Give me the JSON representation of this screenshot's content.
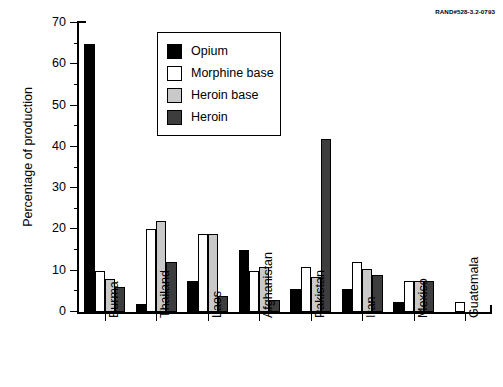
{
  "source_credit": "RAND#528-3.2-0793",
  "chart_data": {
    "type": "bar",
    "title": "",
    "subtitle": "",
    "xlabel": "",
    "ylabel": "Percentage of production",
    "ylim": [
      0,
      70
    ],
    "ytick_values": [
      0,
      10,
      20,
      30,
      40,
      50,
      60,
      70
    ],
    "ytick_labels": [
      "0",
      "10",
      "20",
      "30",
      "40",
      "50",
      "60",
      "70"
    ],
    "grid": false,
    "legend_position": "upper-center-inside",
    "categories": [
      "Burma",
      "Thailand",
      "Laos",
      "Afghanistan",
      "Pakistan",
      "Iran",
      "Mexico",
      "Guatemala"
    ],
    "series": [
      {
        "name": "Opium",
        "color": "#000000",
        "values": [
          65,
          2,
          7.5,
          15,
          5.5,
          5.5,
          2.5,
          0
        ]
      },
      {
        "name": "Morphine base",
        "color": "#ffffff",
        "values": [
          10,
          20,
          19,
          10,
          11,
          12,
          7.5,
          2.5
        ]
      },
      {
        "name": "Heroin base",
        "color": "#c9c9c9",
        "values": [
          8,
          22,
          19,
          11,
          8.5,
          10.5,
          7.5,
          0
        ]
      },
      {
        "name": "Heroin",
        "color": "#3d3d3d",
        "values": [
          6,
          12,
          4,
          3,
          42,
          9,
          7.5,
          0
        ]
      }
    ]
  }
}
